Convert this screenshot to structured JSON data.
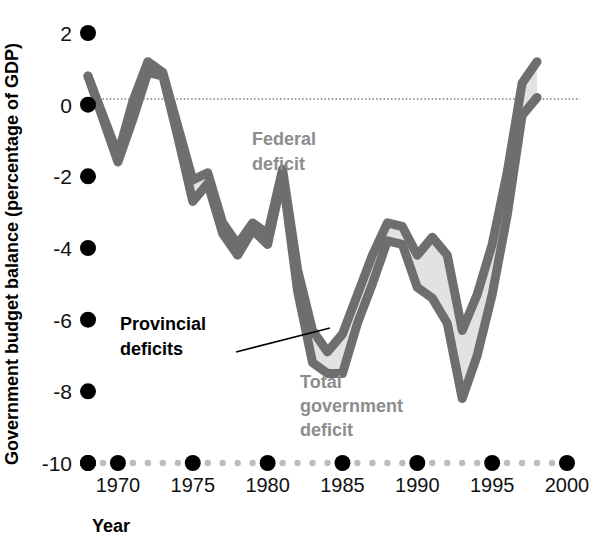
{
  "chart_data": {
    "type": "area",
    "title": "",
    "xlabel": "Year",
    "ylabel": "Government budget balance (percentage of GDP)",
    "xlim": [
      1968,
      1999
    ],
    "ylim": [
      -10,
      2
    ],
    "xticks": [
      "1970",
      "1975",
      "1980",
      "1985",
      "1990",
      "1995",
      "2000"
    ],
    "xtick_values": [
      1970,
      1975,
      1980,
      1985,
      1990,
      1995,
      2000
    ],
    "yticks": [
      "2",
      "0",
      "-2",
      "-4",
      "-6",
      "-8",
      "-10"
    ],
    "ytick_values": [
      2,
      0,
      -2,
      -4,
      -6,
      -8,
      -10
    ],
    "grid": false,
    "zero_line": true,
    "legend_position": "inline-annotations",
    "annotations": [
      {
        "id": "federal",
        "text": "Federal\ndeficit",
        "lines": [
          "Federal",
          "deficit"
        ],
        "color": "#8d8d8d",
        "x": 1980,
        "y": -1.6
      },
      {
        "id": "provincial",
        "text": "Provincial\ndeficits",
        "lines": [
          "Provincial",
          "deficits"
        ],
        "color": "#000000",
        "x": 1974.5,
        "y": -6.6,
        "leader_line": true
      },
      {
        "id": "total",
        "text": "Total\ngovernment\ndeficit",
        "lines": [
          "Total",
          "government",
          "deficit"
        ],
        "color": "#8d8d8d",
        "x": 1981.5,
        "y": -8.3
      }
    ],
    "series": [
      {
        "name": "Federal deficit",
        "color": "#6e6e6e",
        "x": [
          1968,
          1969,
          1970,
          1971,
          1972,
          1973,
          1974,
          1975,
          1976,
          1977,
          1978,
          1979,
          1980,
          1981,
          1982,
          1983,
          1984,
          1985,
          1986,
          1987,
          1988,
          1989,
          1990,
          1991,
          1992,
          1993,
          1994,
          1995,
          1996,
          1997,
          1998
        ],
        "values": [
          0.8,
          -0.3,
          -1.4,
          0.1,
          1.2,
          0.9,
          -0.6,
          -2.1,
          -1.9,
          -3.3,
          -3.9,
          -3.3,
          -3.6,
          -1.8,
          -4.6,
          -6.3,
          -6.9,
          -6.4,
          -5.3,
          -4.2,
          -3.3,
          -3.4,
          -4.2,
          -3.7,
          -4.2,
          -6.3,
          -5.3,
          -3.9,
          -1.9,
          0.6,
          1.2
        ]
      },
      {
        "name": "Total government deficit",
        "color": "#6e6e6e",
        "x": [
          1968,
          1969,
          1970,
          1971,
          1972,
          1973,
          1974,
          1975,
          1976,
          1977,
          1978,
          1979,
          1980,
          1981,
          1982,
          1983,
          1984,
          1985,
          1986,
          1987,
          1988,
          1989,
          1990,
          1991,
          1992,
          1993,
          1994,
          1995,
          1996,
          1997,
          1998
        ],
        "values": [
          0.8,
          -0.4,
          -1.6,
          -0.4,
          0.9,
          0.8,
          -0.9,
          -2.7,
          -2.2,
          -3.6,
          -4.2,
          -3.5,
          -3.9,
          -2.0,
          -5.2,
          -7.2,
          -7.5,
          -7.5,
          -6.1,
          -5.0,
          -3.8,
          -3.9,
          -5.1,
          -5.4,
          -6.1,
          -8.2,
          -7.0,
          -5.3,
          -3.1,
          -0.3,
          0.2
        ]
      }
    ],
    "band": {
      "name": "Provincial deficits",
      "description": "Shaded area between the federal deficit line and the total government deficit line",
      "fill_color": "#e2e2e2",
      "stroke_color": "#6e6e6e"
    }
  },
  "axis": {
    "y_title": "Government budget balance (percentage of GDP)",
    "x_title": "Year"
  },
  "colors": {
    "line": "#6e6e6e",
    "fill": "#e2e2e2",
    "tick_dot_major": "#000000",
    "tick_dot_minor": "#bdbdbd",
    "zero_line": "#9a9a9a",
    "annotation_gray": "#8d8d8d",
    "annotation_black": "#000000"
  }
}
